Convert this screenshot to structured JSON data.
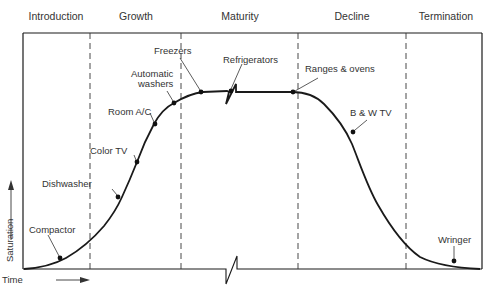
{
  "diagram": {
    "type": "product-life-cycle",
    "phases": [
      "Introduction",
      "Growth",
      "Maturity",
      "Decline",
      "Termination"
    ],
    "axes": {
      "y_label": "Saturation",
      "x_label": "Time"
    },
    "products": [
      {
        "name": "Compactor",
        "phase": "Introduction"
      },
      {
        "name": "Dishwasher",
        "phase": "Growth"
      },
      {
        "name": "Color TV",
        "phase": "Growth"
      },
      {
        "name": "Room A/C",
        "phase": "Growth"
      },
      {
        "name": "Automatic washers",
        "phase": "Growth"
      },
      {
        "name": "Freezers",
        "phase": "Maturity"
      },
      {
        "name": "Refrigerators",
        "phase": "Maturity"
      },
      {
        "name": "Ranges & ovens",
        "phase": "Decline"
      },
      {
        "name": "B & W TV",
        "phase": "Decline"
      },
      {
        "name": "Wringer",
        "phase": "Termination"
      }
    ],
    "labels": {
      "compactor": "Compactor",
      "dishwasher": "Dishwasher",
      "color_tv": "Color TV",
      "room_ac": "Room A/C",
      "auto_washers_1": "Automatic",
      "auto_washers_2": "washers",
      "freezers": "Freezers",
      "refrigerators": "Refrigerators",
      "ranges_ovens": "Ranges & ovens",
      "bw_tv": "B & W TV",
      "wringer": "Wringer"
    },
    "colors": {
      "line": "#1a1a1a",
      "text": "#333333",
      "background": "#ffffff"
    }
  }
}
